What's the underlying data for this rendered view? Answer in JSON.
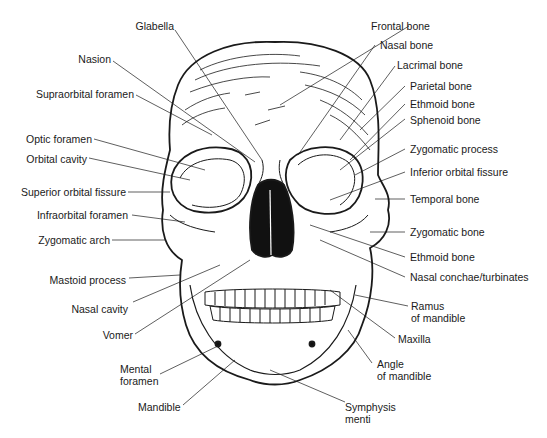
{
  "diagram": {
    "labels_left": [
      {
        "id": "glabella",
        "text": "Glabella"
      },
      {
        "id": "nasion",
        "text": "Nasion"
      },
      {
        "id": "supraorbital-foramen",
        "text": "Supraorbital foramen"
      },
      {
        "id": "optic-foramen",
        "text": "Optic foramen"
      },
      {
        "id": "orbital-cavity",
        "text": "Orbital cavity"
      },
      {
        "id": "superior-orbital-fissure",
        "text": "Superior orbital fissure"
      },
      {
        "id": "infraorbital-foramen",
        "text": "Infraorbital foramen"
      },
      {
        "id": "zygomatic-arch",
        "text": "Zygomatic arch"
      },
      {
        "id": "mastoid-process",
        "text": "Mastoid process"
      },
      {
        "id": "nasal-cavity",
        "text": "Nasal cavity"
      },
      {
        "id": "vomer",
        "text": "Vomer"
      },
      {
        "id": "mental-foramen",
        "text": "Mental\nforamen"
      },
      {
        "id": "mandible",
        "text": "Mandible"
      }
    ],
    "labels_right": [
      {
        "id": "frontal-bone",
        "text": "Frontal bone"
      },
      {
        "id": "nasal-bone",
        "text": "Nasal bone"
      },
      {
        "id": "lacrimal-bone",
        "text": "Lacrimal bone"
      },
      {
        "id": "parietal-bone",
        "text": "Parietal bone"
      },
      {
        "id": "ethmoid-bone-upper",
        "text": "Ethmoid bone"
      },
      {
        "id": "sphenoid-bone",
        "text": "Sphenoid bone"
      },
      {
        "id": "zygomatic-process",
        "text": "Zygomatic process"
      },
      {
        "id": "inferior-orbital-fissure",
        "text": "Inferior orbital fissure"
      },
      {
        "id": "temporal-bone",
        "text": "Temporal bone"
      },
      {
        "id": "zygomatic-bone",
        "text": "Zygomatic bone"
      },
      {
        "id": "ethmoid-bone-lower",
        "text": "Ethmoid bone"
      },
      {
        "id": "nasal-conchae",
        "text": "Nasal conchae/turbinates"
      },
      {
        "id": "ramus-of-mandible",
        "text": "Ramus\nof mandible"
      },
      {
        "id": "maxilla",
        "text": "Maxilla"
      },
      {
        "id": "angle-of-mandible",
        "text": "Angle\nof mandible"
      },
      {
        "id": "symphysis-menti",
        "text": "Symphysis\nmenti"
      }
    ],
    "colors": {
      "line": "#1a1a1a",
      "fill": "#ffffff",
      "dark": "#111111"
    }
  }
}
